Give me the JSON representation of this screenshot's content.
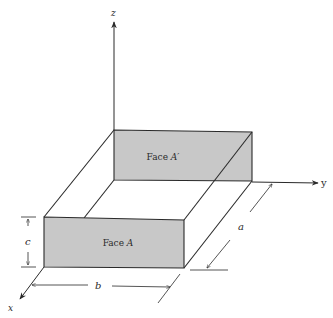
{
  "diagram": {
    "type": "3d-rectangular-box",
    "axes": {
      "x": {
        "label": "x"
      },
      "y": {
        "label": "y"
      },
      "z": {
        "label": "z"
      }
    },
    "faces": [
      {
        "id": "front",
        "label_prefix": "Face ",
        "label_var": "A"
      },
      {
        "id": "back",
        "label_prefix": "Face ",
        "label_var": "A′"
      }
    ],
    "dimensions": {
      "a": "a",
      "b": "b",
      "c": "c"
    },
    "colors": {
      "face_fill": "#c8c8c8",
      "line": "#2a2a2a",
      "background": "#ffffff"
    }
  }
}
